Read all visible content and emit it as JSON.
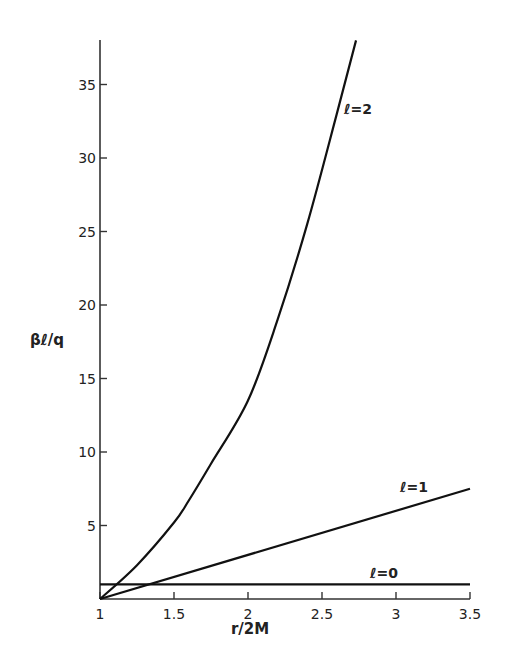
{
  "chart_data": {
    "type": "line",
    "title": "",
    "xlabel": "r/2M",
    "ylabel": "βℓ/q",
    "xlim": [
      1,
      3.5
    ],
    "ylim": [
      0,
      38
    ],
    "x_ticks": [
      "1",
      "1.5",
      "2",
      "2.5",
      "3",
      "3.5"
    ],
    "y_ticks": [
      "5",
      "10",
      "15",
      "20",
      "25",
      "30",
      "35"
    ],
    "grid": false,
    "legend": "inline labels",
    "series": [
      {
        "name": "ℓ=0",
        "label": "ℓ=0",
        "x": [
          1,
          3.5
        ],
        "y": [
          1,
          1
        ]
      },
      {
        "name": "ℓ=1",
        "label": "ℓ=1",
        "x": [
          1,
          3.5
        ],
        "y": [
          0,
          7.5
        ]
      },
      {
        "name": "ℓ=2",
        "label": "ℓ=2",
        "x": [
          1,
          1.25,
          1.5,
          1.6,
          1.75,
          2.0,
          2.2,
          2.4,
          2.6,
          2.73
        ],
        "y": [
          0,
          2.3,
          5.2,
          6.7,
          9.2,
          13.5,
          19.0,
          25.5,
          33.0,
          38.0
        ]
      }
    ]
  }
}
